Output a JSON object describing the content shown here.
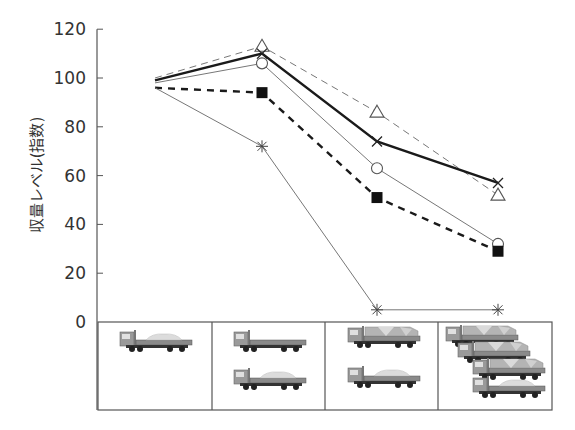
{
  "chart_data": {
    "type": "line",
    "title": "",
    "xlabel": "",
    "ylabel": "収量レベル(指数)",
    "ylim": [
      0,
      120
    ],
    "yticks": [
      0,
      20,
      40,
      60,
      80,
      100,
      120
    ],
    "grid": false,
    "legend": null,
    "categories": [
      "1 truck (light load)",
      "2 trucks (1 empty, 1 light load)",
      "2 trucks (1 fully loaded, 1 light load)",
      "4 trucks (3 fully loaded, 1 light load)"
    ],
    "x_panel_icons": [
      [
        {
          "load": "light"
        }
      ],
      [
        {
          "load": "empty"
        },
        {
          "load": "light"
        }
      ],
      [
        {
          "load": "full"
        },
        {
          "load": "light"
        }
      ],
      [
        {
          "load": "full"
        },
        {
          "load": "full"
        },
        {
          "load": "full"
        },
        {
          "load": "light"
        }
      ]
    ],
    "series": [
      {
        "name": "triangle-thin-dashed",
        "marker": "triangle-open",
        "line": "thin-dashed",
        "values": [
          100,
          113,
          86,
          52
        ],
        "show_first_marker": false
      },
      {
        "name": "x-thick-solid",
        "marker": "x",
        "line": "thick-solid",
        "values": [
          99,
          110,
          74,
          57
        ],
        "show_first_marker": false
      },
      {
        "name": "circle-thin-solid",
        "marker": "circle-open",
        "line": "thin-solid",
        "values": [
          98,
          106,
          63,
          32
        ],
        "show_first_marker": false
      },
      {
        "name": "square-thick-dashed",
        "marker": "square-filled",
        "line": "thick-dashed",
        "values": [
          96,
          94,
          51,
          29
        ],
        "show_first_marker": false
      },
      {
        "name": "asterisk-thin-solid",
        "marker": "asterisk",
        "line": "thin-solid",
        "values": [
          96,
          72,
          5,
          5
        ],
        "show_first_marker": false
      }
    ]
  },
  "colors": {
    "ink": "#1a1a1a",
    "grey_line": "#777777",
    "axis": "#555555"
  }
}
